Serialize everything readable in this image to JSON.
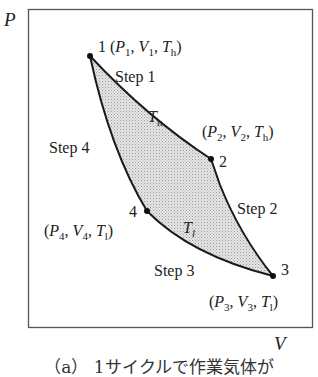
{
  "axes": {
    "y_label": "P",
    "x_label": "V"
  },
  "points": [
    {
      "id": "1",
      "label": "1",
      "state": [
        "P",
        "1",
        "V",
        "1",
        "T",
        "h"
      ]
    },
    {
      "id": "2",
      "label": "2",
      "state": [
        "P",
        "2",
        "V",
        "2",
        "T",
        "h"
      ]
    },
    {
      "id": "3",
      "label": "3",
      "state": [
        "P",
        "3",
        "V",
        "3",
        "T",
        "l"
      ]
    },
    {
      "id": "4",
      "label": "4",
      "state": [
        "P",
        "4",
        "V",
        "4",
        "T",
        "l"
      ]
    }
  ],
  "steps": {
    "step1": "Step 1",
    "step2": "Step 2",
    "step3": "Step 3",
    "step4": "Step 4"
  },
  "isotherms": {
    "hot": {
      "symbol": "T",
      "sub": "h"
    },
    "cold": {
      "symbol": "T",
      "sub": "l"
    }
  },
  "caption": "（a） 1サイクルで作業気体が",
  "colors": {
    "line": "#1a1a1a",
    "fill": "#d4d4d4",
    "frame": "#555555"
  }
}
